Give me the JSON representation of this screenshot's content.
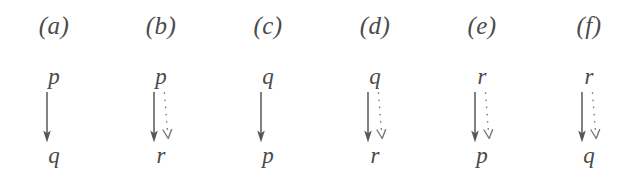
{
  "figure": {
    "background_color": "#ffffff",
    "ink_color": "#4b4b4b",
    "dotted_ink_color": "#74797c",
    "panel_count": 6,
    "panel_spacing_px": 108
  },
  "panels": [
    {
      "label": "(a)",
      "top_term": "p",
      "bottom_term": "q",
      "solid_arrow": true,
      "dotted_arrow": false,
      "left_px": 0
    },
    {
      "label": "(b)",
      "top_term": "p",
      "bottom_term": "r",
      "solid_arrow": true,
      "dotted_arrow": true,
      "left_px": 107
    },
    {
      "label": "(c)",
      "top_term": "q",
      "bottom_term": "p",
      "solid_arrow": true,
      "dotted_arrow": false,
      "left_px": 214
    },
    {
      "label": "(d)",
      "top_term": "q",
      "bottom_term": "r",
      "solid_arrow": true,
      "dotted_arrow": true,
      "left_px": 321
    },
    {
      "label": "(e)",
      "top_term": "r",
      "bottom_term": "p",
      "solid_arrow": true,
      "dotted_arrow": true,
      "left_px": 428
    },
    {
      "label": "(f)",
      "top_term": "r",
      "bottom_term": "q",
      "solid_arrow": true,
      "dotted_arrow": true,
      "left_px": 535
    }
  ]
}
